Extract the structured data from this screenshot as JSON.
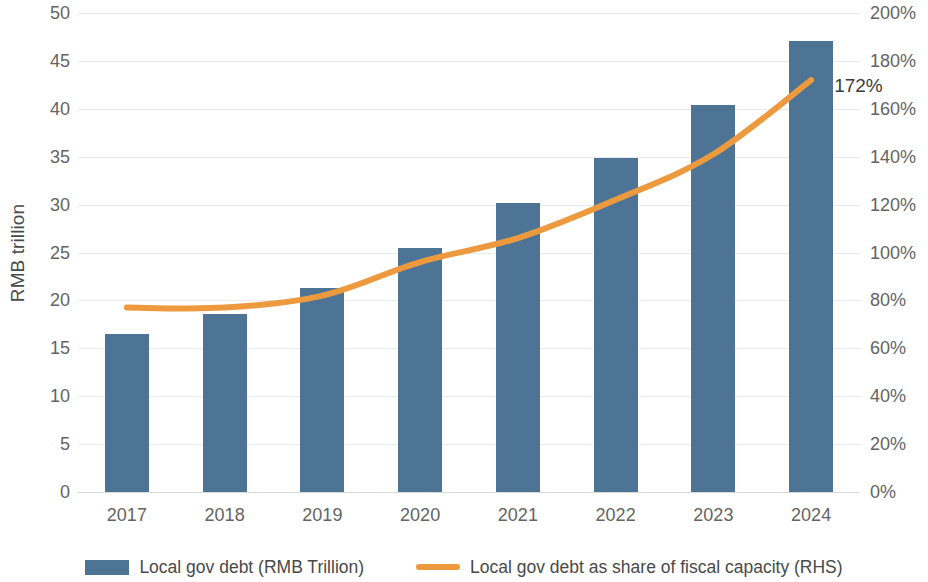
{
  "chart_data": {
    "type": "bar",
    "title": "",
    "categories": [
      "2017",
      "2018",
      "2019",
      "2020",
      "2021",
      "2022",
      "2023",
      "2024"
    ],
    "xlabel": "",
    "ylabel": "RMB trillion",
    "ylabel_right": "",
    "ylim": [
      0,
      50
    ],
    "ylim_right": [
      0,
      200
    ],
    "y_ticks": [
      "0",
      "5",
      "10",
      "15",
      "20",
      "25",
      "30",
      "35",
      "40",
      "45",
      "50"
    ],
    "y_ticks_right": [
      "0%",
      "20%",
      "40%",
      "60%",
      "80%",
      "100%",
      "120%",
      "140%",
      "160%",
      "180%",
      "200%"
    ],
    "grid": true,
    "legend_position": "bottom",
    "series": [
      {
        "name": "Local gov debt (RMB Trillion)",
        "type": "bar",
        "axis": "left",
        "color": "#4d7495",
        "values": [
          16.5,
          18.6,
          21.3,
          25.5,
          30.2,
          34.9,
          40.4,
          47.1
        ]
      },
      {
        "name": "Local gov debt as share of fiscal capacity (RHS)",
        "type": "line",
        "axis": "right",
        "color": "#ed9a3f",
        "values": [
          77,
          77,
          82,
          96,
          106,
          122,
          141,
          172
        ]
      }
    ],
    "annotations": [
      {
        "text": "172%",
        "series": "Local gov debt as share of fiscal capacity (RHS)",
        "category": "2024",
        "value": 172
      }
    ]
  },
  "legend": {
    "items": [
      {
        "label": "Local gov debt (RMB Trillion)",
        "marker": "bar-swatch",
        "color": "#4d7495"
      },
      {
        "label": "Local gov debt as share of fiscal capacity (RHS)",
        "marker": "line-swatch",
        "color": "#ed9a3f"
      }
    ]
  }
}
